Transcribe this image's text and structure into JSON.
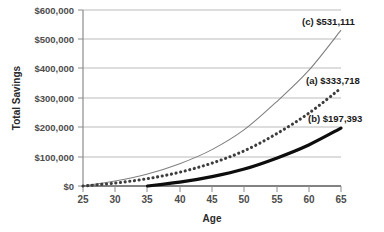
{
  "chart_data": {
    "type": "line",
    "title": "",
    "xlabel": "Age",
    "ylabel": "Total Savings",
    "xlim": [
      25,
      65
    ],
    "ylim": [
      0,
      600000
    ],
    "grid": true,
    "legend_position": "inline-annotations",
    "x_ticks": [
      "25",
      "30",
      "35",
      "40",
      "45",
      "50",
      "55",
      "60",
      "65"
    ],
    "y_ticks": [
      "$0",
      "$100,000",
      "$200,000",
      "$300,000",
      "$400,000",
      "$500,000",
      "$600,000"
    ],
    "x_tick_values": [
      25,
      30,
      35,
      40,
      45,
      50,
      55,
      60,
      65
    ],
    "y_tick_values": [
      0,
      100000,
      200000,
      300000,
      400000,
      500000,
      600000
    ],
    "series": [
      {
        "name": "c",
        "label": "(c) $531,111",
        "end_value": 531111,
        "style": "thin-gray-line",
        "color": "#808080",
        "x": [
          25,
          30,
          35,
          40,
          45,
          50,
          55,
          60,
          65
        ],
        "values": [
          0,
          17000,
          41000,
          76000,
          124000,
          192000,
          287000,
          394000,
          531111
        ]
      },
      {
        "name": "a",
        "label": "(a) $333,718",
        "end_value": 333718,
        "style": "dotted-dark",
        "color": "#3d3d3d",
        "x": [
          25,
          30,
          35,
          40,
          45,
          50,
          55,
          60,
          65
        ],
        "values": [
          0,
          10000,
          25000,
          47000,
          78000,
          120000,
          178000,
          248000,
          333718
        ]
      },
      {
        "name": "b",
        "label": "(b) $197,393",
        "end_value": 197393,
        "style": "thick-black",
        "color": "#0d0d0d",
        "x": [
          35,
          40,
          45,
          50,
          55,
          60,
          65
        ],
        "values": [
          0,
          13000,
          32000,
          58000,
          95000,
          140000,
          197393
        ]
      }
    ],
    "annotations": [
      {
        "text": "(c) $531,111",
        "series": "c"
      },
      {
        "text": "(a) $333,718",
        "series": "a"
      },
      {
        "text": "(b) $197,393",
        "series": "b"
      }
    ]
  }
}
